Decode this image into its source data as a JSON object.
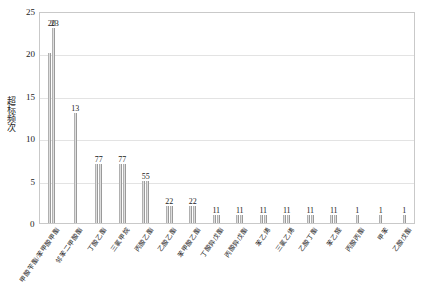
{
  "chart_data": {
    "type": "bar",
    "title": "",
    "subtitle": "",
    "xlabel": "",
    "ylabel": "超标频次",
    "ylim": [
      0,
      25
    ],
    "yticks": [
      0,
      5,
      10,
      15,
      20,
      25
    ],
    "grid": true,
    "legend": false,
    "legend_position": "none",
    "note": "Grouped bars: each category shows one or two adjacent bars; the printed data label concatenates the values of the bars in that group (e.g. '77' = two bars of 7).",
    "categories": [
      "甲酸苄酯/苯甲酸甲酯",
      "邻苯二甲酸酯",
      "丁酸乙酯",
      "三氯甲烷",
      "丙酸乙酯",
      "乙酸乙酯",
      "苯甲酸乙酯",
      "丁酸异戊酯",
      "丙酸异戊酯",
      "苯乙烯",
      "三氯乙烯",
      "乙酸丁酯",
      "苯乙醛",
      "丙酸丙酯",
      "甲苯"
    ],
    "groups": [
      {
        "category": "甲酸苄酯/苯甲酸甲酯",
        "values": [
          20,
          23
        ],
        "label": "20"
      },
      {
        "category": "邻苯二甲酸酯",
        "values": [
          13
        ],
        "label": "13"
      },
      {
        "category": "丁酸乙酯",
        "values": [
          7,
          7
        ],
        "label": "77"
      },
      {
        "category": "三氯甲烷",
        "values": [
          7,
          7
        ],
        "label": "77"
      },
      {
        "category": "丙酸乙酯",
        "values": [
          5,
          5
        ],
        "label": "55"
      },
      {
        "category": "乙酸乙酯",
        "values": [
          2,
          2
        ],
        "label": "22"
      },
      {
        "category": "苯甲酸乙酯",
        "values": [
          2,
          2
        ],
        "label": "22"
      },
      {
        "category": "丁酸异戊酯",
        "values": [
          1,
          1
        ],
        "label": "11"
      },
      {
        "category": "丙酸异戊酯",
        "values": [
          1,
          1
        ],
        "label": "11"
      },
      {
        "category": "苯乙烯",
        "values": [
          1,
          1
        ],
        "label": "11"
      },
      {
        "category": "三氯乙烯",
        "values": [
          1,
          1
        ],
        "label": "11"
      },
      {
        "category": "乙酸丁酯",
        "values": [
          1,
          1
        ],
        "label": "11"
      },
      {
        "category": "苯乙醛",
        "values": [
          1,
          1
        ],
        "label": "11"
      },
      {
        "category": "丙酸丙酯",
        "values": [
          1
        ],
        "label": "1"
      },
      {
        "category": "甲苯",
        "values": [
          1
        ],
        "label": "1"
      },
      {
        "category": "乙酸戊酯",
        "values": [
          1
        ],
        "label": "1"
      }
    ],
    "top_bar_labels": [
      "23",
      "20"
    ],
    "colors": {
      "bar_light": "#d9d9d9",
      "bar_dark": "#8f8f8f",
      "gridline": "#e3e3e3",
      "axis": "#c9c9c9",
      "text": "#1a1a1a",
      "background": "#ffffff"
    }
  }
}
